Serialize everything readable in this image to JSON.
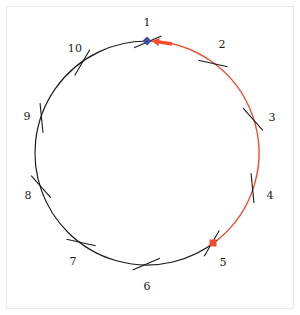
{
  "figure": {
    "title": "",
    "background_color": "#ffffff",
    "frame_color": "#e8e8e8"
  },
  "chart_data": {
    "type": "scatter",
    "title": "",
    "xlabel": "",
    "ylabel": "",
    "geometry": {
      "center_x": 147,
      "center_y": 153,
      "radius": 112,
      "start_angle_deg": -90,
      "direction": "clockwise",
      "positions_count": 10,
      "degrees_per_position": 36
    },
    "categories": [
      "1",
      "2",
      "3",
      "4",
      "5",
      "6",
      "7",
      "8",
      "9",
      "10"
    ],
    "tick_labels": [
      {
        "label": "1",
        "angle_deg": 0,
        "x": 147,
        "y": 22,
        "offset_radius": 131
      },
      {
        "label": "2",
        "angle_deg": 36,
        "x": 222,
        "y": 44,
        "offset_radius": 131
      },
      {
        "label": "3",
        "angle_deg": 72,
        "x": 272,
        "y": 117,
        "offset_radius": 131
      },
      {
        "label": "4",
        "angle_deg": 108,
        "x": 270,
        "y": 195,
        "offset_radius": 131
      },
      {
        "label": "5",
        "angle_deg": 144,
        "x": 223,
        "y": 262,
        "offset_radius": 131
      },
      {
        "label": "6",
        "angle_deg": 180,
        "x": 147,
        "y": 286,
        "offset_radius": 131
      },
      {
        "label": "7",
        "angle_deg": 216,
        "x": 73,
        "y": 261,
        "offset_radius": 131
      },
      {
        "label": "8",
        "angle_deg": 252,
        "x": 28,
        "y": 195,
        "offset_radius": 131
      },
      {
        "label": "9",
        "angle_deg": 288,
        "x": 27,
        "y": 116,
        "offset_radius": 131
      },
      {
        "label": "10",
        "angle_deg": 324,
        "x": 75,
        "y": 48,
        "offset_radius": 131
      }
    ],
    "arcs": [
      {
        "name": "highlighted-arc",
        "color": "#f4492d",
        "start_label": "1",
        "end_label": "5",
        "start_angle_deg": 0,
        "end_angle_deg": 141,
        "line_width": 1.4
      },
      {
        "name": "base-arc",
        "color": "#1a1a1a",
        "start_label": "5",
        "end_label": "1",
        "start_angle_deg": 141,
        "end_angle_deg": 360,
        "line_width": 1.2
      }
    ],
    "markers": [
      {
        "name": "start-marker",
        "shape": "diamond",
        "color": "#3b4f9e",
        "at_label": "1",
        "angle_deg": 0,
        "x": 147,
        "y": 41,
        "size": 7
      },
      {
        "name": "end-marker",
        "shape": "square",
        "color": "#f4492d",
        "at_label": "5",
        "angle_deg": 141,
        "x": 213,
        "y": 243,
        "size": 7
      }
    ],
    "annotations": [
      {
        "name": "direction-arrow",
        "color": "#f4492d",
        "points_to": "1",
        "description": "arrow head pointing counterclockwise toward position 1",
        "tail_x": 172,
        "tail_y": 44,
        "head_x": 152,
        "head_y": 41
      }
    ],
    "legend": {
      "visible": false,
      "entries": []
    },
    "grid": false
  }
}
